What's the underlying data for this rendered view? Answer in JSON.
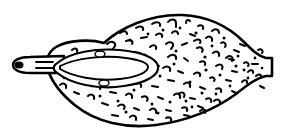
{
  "figure": {
    "title": "Fruit longitudinal section line drawing",
    "style": "ink line drawing with stippled surface texture",
    "background_color": "#ffffff",
    "ink_color": "#000000",
    "canvas": {
      "width": 289,
      "height": 133
    }
  },
  "parts": {
    "body": {
      "label": "fruit body",
      "description": "broad elongated oval, widest left of center, tapering to a truncated tip at right",
      "outline_path": "M 104 43 C 120 28, 150 14, 182 15 C 206 16, 228 26, 244 42 C 252 50, 258 56, 266 58 L 272 58 L 272 76 L 266 76 C 256 78, 246 86, 236 94 C 214 110, 186 121, 156 125 C 126 129, 96 122, 76 106 C 62 95, 52 82, 48 70 C 45 61, 48 52, 56 47 C 68 40, 90 39, 104 43 Z",
      "stroke_width": 2.6
    },
    "stem": {
      "label": "stem / peduncle",
      "description": "short tapered stalk protruding from the left, rounded tip with dark scar",
      "outline_path": "M 64 56 L 30 57 C 20 57, 13 60, 13 65 C 13 70, 20 73, 30 73 L 64 73 Z",
      "tip_dot": {
        "cx": 19,
        "cy": 65,
        "rx": 4.5,
        "ry": 3.6
      },
      "marks": [
        "M 36 62 L 53 62",
        "M 36 68 L 53 68"
      ]
    },
    "seed": {
      "label": "seed / pit",
      "description": "large pointed ellipse set in the left portion of the flesh",
      "outline_path": "M 56 64 C 70 52, 96 48, 120 50 C 142 52, 156 58, 158 66 C 160 75, 146 83, 124 86 C 98 90, 70 84, 56 72 C 53 70, 53 66, 56 64 Z",
      "inner_path": "M 60 66 C 76 58, 104 55, 126 58 C 140 60, 148 63, 148 67 C 148 72, 138 77, 120 79 C 96 82, 72 76, 60 69 Z",
      "nodes": [
        {
          "cx": 100,
          "cy": 54,
          "rx": 5,
          "ry": 3
        },
        {
          "cx": 104,
          "cy": 83,
          "rx": 5,
          "ry": 3
        }
      ]
    },
    "texture": {
      "label": "surface stipple texture",
      "description": "scattered short comma, hook and dash strokes covering the fruit surface",
      "mark_count": 132
    }
  },
  "texture_marks": [
    "M 120 33 c 3 -3 7 -2 7 1",
    "M 136 28 c 4 -3 8 -1 7 2",
    "M 152 24 c 4 -3 9 -2 8 2",
    "M 168 22 c 3 -4 8 -3 8 1 l 0 4",
    "M 186 23 c 0 -3 2 -4 4 -2",
    "M 198 26 c 3 -2 6 0 5 3",
    "M 212 31 c 3 -3 7 -2 7 2",
    "M 107 44 c 4 -4 9 -2 8 2 l -3 4",
    "M 126 41 c 4 -2 8 0 6 3",
    "M 141 38 l 6 -1",
    "M 156 35 c 3 -3 7 -1 6 2",
    "M 172 33 c 2 -3 6 -2 6 1",
    "M 190 34 l 5 2",
    "M 206 38 c 3 -3 7 -1 6 3",
    "M 221 43 c 3 -2 6 1 4 4",
    "M 234 50 l 5 2",
    "M 92 53 l 5 -1",
    "M 80 59 c 2 -3 6 -2 5 1",
    "M 72 50 c 3 -3 6 -1 5 2",
    "M 116 55 c 4 -3 9 -1 7 3",
    "M 134 52 l 6 1",
    "M 150 47 c 3 -3 7 -2 6 2",
    "M 166 44 c 3 -3 8 -2 7 2 l -2 3",
    "M 182 45 l 5 -2",
    "M 197 48 c 4 -2 7 1 5 4",
    "M 213 53 c 3 -3 7 -1 6 3",
    "M 229 59 l 5 1",
    "M 244 63 c 3 -2 6 1 4 3",
    "M 168 57 c 4 -4 9 -2 8 2",
    "M 184 58 l 4 3",
    "M 200 62 c 3 -2 6 0 5 3",
    "M 216 66 c 4 -3 8 -1 6 3",
    "M 232 71 l 5 1",
    "M 248 72 c 2 -3 6 -2 5 1",
    "M 163 68 c 4 -3 8 -1 7 3",
    "M 178 71 l 5 2",
    "M 194 74 c 3 -3 7 -1 6 2",
    "M 210 78 c 3 -2 6 1 4 3",
    "M 226 80 l 5 1",
    "M 242 82 c 2 -3 6 -2 5 1",
    "M 168 80 l 6 1",
    "M 184 84 c 3 -3 7 -1 6 3",
    "M 200 87 l 5 2",
    "M 216 89 c 3 -2 6 0 5 3",
    "M 232 91 l 4 2",
    "M 80 78 c 3 -3 7 -1 6 3",
    "M 66 72 l 5 2",
    "M 94 86 c 4 -3 8 -1 6 3",
    "M 110 92 l 6 1",
    "M 126 95 c 3 -3 7 -1 6 3",
    "M 142 97 c 4 -2 7 1 5 4",
    "M 158 97 l 5 2",
    "M 174 95 c 3 -3 7 -1 6 3",
    "M 190 98 l 5 1",
    "M 206 99 c 3 -2 6 0 5 3",
    "M 88 96 c 3 -3 7 -1 6 3",
    "M 102 103 l 6 2",
    "M 118 106 c 4 -3 8 -1 6 3",
    "M 134 108 l 5 2",
    "M 150 110 c 3 -3 7 -1 6 3",
    "M 166 110 l 5 1",
    "M 182 108 c 3 -2 6 0 5 3",
    "M 198 106 l 5 2",
    "M 214 101 c 3 -3 7 -1 6 3",
    "M 112 115 l 6 1",
    "M 130 117 c 3 -3 7 -1 6 3",
    "M 148 119 l 5 1",
    "M 166 118 c 3 -2 6 0 5 3",
    "M 184 115 l 5 1",
    "M 200 111 c 3 -3 7 -1 5 2",
    "M 140 60 c 5 -4 10 -2 9 2 l -3 4",
    "M 154 63 l 5 3",
    "M 60 85 c 3 -3 7 -1 6 3",
    "M 74 92 l 5 2",
    "M 226 58 c 4 -4 8 -1 6 3",
    "M 240 44 l 5 2",
    "M 252 64 l 6 0",
    "M 256 76 c 3 -3 6 -1 5 2",
    "M 258 50 c 3 -2 6 1 4 3",
    "M 260 86 l 4 2",
    "M 194 41 c 4 -3 8 -1 6 2",
    "M 178 94 c 4 -3 8 -1 6 3",
    "M 152 86 l 6 1",
    "M 136 84 c 3 -2 6 0 5 3",
    "M 120 79 c 3 -3 6 -1 5 2"
  ],
  "texture_dots": [
    {
      "cx": 130,
      "cy": 40,
      "r": 1.6
    },
    {
      "cx": 163,
      "cy": 30,
      "r": 1.5
    },
    {
      "cx": 196,
      "cy": 33,
      "r": 1.6
    },
    {
      "cx": 224,
      "cy": 38,
      "r": 1.5
    },
    {
      "cx": 110,
      "cy": 50,
      "r": 1.5
    },
    {
      "cx": 145,
      "cy": 55,
      "r": 1.6
    },
    {
      "cx": 176,
      "cy": 51,
      "r": 1.5
    },
    {
      "cx": 205,
      "cy": 57,
      "r": 1.6
    },
    {
      "cx": 238,
      "cy": 56,
      "r": 1.5
    },
    {
      "cx": 174,
      "cy": 64,
      "r": 1.5
    },
    {
      "cx": 206,
      "cy": 70,
      "r": 1.6
    },
    {
      "cx": 236,
      "cy": 66,
      "r": 1.5
    },
    {
      "cx": 255,
      "cy": 58,
      "r": 1.4
    },
    {
      "cx": 160,
      "cy": 76,
      "r": 1.5
    },
    {
      "cx": 190,
      "cy": 82,
      "r": 1.5
    },
    {
      "cx": 220,
      "cy": 75,
      "r": 1.5
    },
    {
      "cx": 86,
      "cy": 70,
      "r": 1.5
    },
    {
      "cx": 70,
      "cy": 62,
      "r": 1.4
    },
    {
      "cx": 100,
      "cy": 96,
      "r": 1.5
    },
    {
      "cx": 134,
      "cy": 90,
      "r": 1.5
    },
    {
      "cx": 170,
      "cy": 102,
      "r": 1.5
    },
    {
      "cx": 202,
      "cy": 93,
      "r": 1.5
    },
    {
      "cx": 230,
      "cy": 86,
      "r": 1.4
    },
    {
      "cx": 118,
      "cy": 101,
      "r": 1.5
    },
    {
      "cx": 152,
      "cy": 104,
      "r": 1.5
    },
    {
      "cx": 186,
      "cy": 101,
      "r": 1.5
    },
    {
      "cx": 216,
      "cy": 94,
      "r": 1.4
    },
    {
      "cx": 126,
      "cy": 112,
      "r": 1.5
    },
    {
      "cx": 158,
      "cy": 113,
      "r": 1.5
    },
    {
      "cx": 192,
      "cy": 107,
      "r": 1.4
    },
    {
      "cx": 92,
      "cy": 86,
      "r": 1.4
    },
    {
      "cx": 78,
      "cy": 82,
      "r": 1.4
    },
    {
      "cx": 64,
      "cy": 78,
      "r": 1.3
    },
    {
      "cx": 248,
      "cy": 78,
      "r": 1.4
    },
    {
      "cx": 262,
      "cy": 68,
      "r": 1.3
    },
    {
      "cx": 148,
      "cy": 34,
      "r": 1.4
    },
    {
      "cx": 180,
      "cy": 28,
      "r": 1.4
    },
    {
      "cx": 212,
      "cy": 46,
      "r": 1.4
    },
    {
      "cx": 244,
      "cy": 70,
      "r": 1.4
    },
    {
      "cx": 106,
      "cy": 62,
      "r": 1.4
    }
  ]
}
